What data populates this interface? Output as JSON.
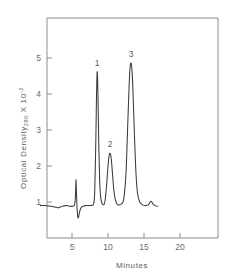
{
  "chart_data": {
    "type": "line",
    "title": "",
    "xlabel": "Minutes",
    "ylabel": "Optical Density",
    "ylabel_subscript": "280",
    "ylabel_multiplier_prefix": "X 10",
    "ylabel_multiplier_exponent": "-2",
    "xlim": [
      0,
      23.6
    ],
    "ylim": [
      0,
      6.1
    ],
    "xticks": [
      5,
      10,
      15,
      20
    ],
    "xtick_labels": [
      "5",
      "10",
      "15",
      "20"
    ],
    "yticks": [
      1,
      2,
      3,
      4,
      5
    ],
    "ytick_labels": [
      "1",
      "2",
      "3",
      "4",
      "5"
    ],
    "grid": false,
    "legend": "none",
    "baseline": 0.92,
    "trace_start_x": 0.6,
    "trace_end_x": 16.9,
    "annotations": [
      {
        "label": "1",
        "x": 8.5,
        "y": 4.62
      },
      {
        "label": "2",
        "x": 10.3,
        "y": 2.35
      },
      {
        "label": "3",
        "x": 13.2,
        "y": 4.86
      }
    ],
    "peaks": [
      {
        "id": "1",
        "retention_time": 8.5,
        "height": 4.62,
        "width": 0.42
      },
      {
        "id": "2",
        "retention_time": 10.3,
        "height": 2.35,
        "width": 0.55
      },
      {
        "id": "3",
        "retention_time": 13.2,
        "height": 4.86,
        "width": 0.62
      }
    ],
    "injection_spike": {
      "retention_time": 5.55,
      "up_height": 1.62,
      "down_height": 0.55
    },
    "minor_features": [
      {
        "retention_time": 3.1,
        "height": 0.84,
        "note": "shallow baseline dip"
      },
      {
        "retention_time": 4.3,
        "height": 0.9,
        "note": "small baseline bump"
      },
      {
        "retention_time": 16.0,
        "height": 1.02,
        "note": "small trailing bump"
      }
    ],
    "series": [
      {
        "name": "chromatogram",
        "x": [
          0.6,
          1.2,
          1.8,
          2.4,
          3.0,
          3.1,
          3.4,
          3.8,
          4.1,
          4.3,
          4.5,
          4.8,
          5.1,
          5.3,
          5.42,
          5.5,
          5.55,
          5.62,
          5.7,
          5.78,
          5.86,
          5.95,
          6.1,
          6.3,
          6.6,
          7.0,
          7.4,
          7.8,
          8.0,
          8.15,
          8.3,
          8.4,
          8.5,
          8.6,
          8.7,
          8.85,
          9.0,
          9.2,
          9.45,
          9.6,
          9.8,
          10.0,
          10.15,
          10.3,
          10.45,
          10.6,
          10.8,
          11.0,
          11.3,
          11.6,
          11.9,
          12.2,
          12.5,
          12.7,
          12.9,
          13.05,
          13.2,
          13.35,
          13.5,
          13.7,
          13.9,
          14.1,
          14.4,
          14.8,
          15.2,
          15.6,
          15.8,
          16.0,
          16.2,
          16.5,
          16.9
        ],
        "y": [
          0.9,
          0.9,
          0.89,
          0.87,
          0.84,
          0.84,
          0.86,
          0.89,
          0.9,
          0.9,
          0.89,
          0.88,
          0.88,
          0.9,
          1.0,
          1.3,
          1.62,
          1.25,
          0.85,
          0.62,
          0.55,
          0.62,
          0.76,
          0.85,
          0.89,
          0.9,
          0.9,
          0.91,
          0.95,
          1.25,
          2.6,
          3.9,
          4.62,
          4.05,
          2.8,
          1.55,
          1.1,
          0.95,
          0.93,
          1.05,
          1.45,
          2.0,
          2.28,
          2.35,
          2.2,
          1.85,
          1.35,
          1.08,
          0.93,
          0.92,
          0.95,
          1.1,
          1.8,
          2.9,
          4.05,
          4.7,
          4.86,
          4.6,
          3.9,
          2.7,
          1.75,
          1.25,
          1.0,
          0.92,
          0.9,
          0.92,
          0.98,
          1.02,
          0.96,
          0.9,
          0.88
        ]
      }
    ]
  },
  "figure": {
    "y_axis_label_text": "Optical  Density",
    "y_axis_subscript": "280",
    "y_axis_scale_x": "X",
    "y_axis_scale_base": "10",
    "y_axis_scale_exp": "-2",
    "x_axis_label_text": "Minutes"
  }
}
